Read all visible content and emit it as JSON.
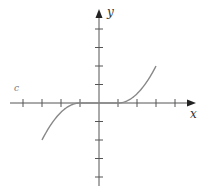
{
  "chart_data": {
    "type": "line",
    "title": "",
    "xlabel": "x",
    "ylabel": "y",
    "stray_label": "c",
    "xlim": [
      -4,
      4
    ],
    "ylim": [
      -4,
      4
    ],
    "x_ticks": [
      -4,
      -3,
      -2,
      -1,
      1,
      2,
      3,
      4
    ],
    "y_ticks": [
      -4,
      -3,
      -2,
      -1,
      1,
      2,
      3,
      4
    ],
    "tick_labels_shown": false,
    "grid": false,
    "series": [
      {
        "name": "f(x)",
        "description": "flat at 0 on [-1,1], rising as (x-1)^2/2 for x>1, falling as -(x+1)^2/2 for x<-1",
        "x": [
          -3,
          -2.5,
          -2,
          -1.5,
          -1,
          0,
          1,
          1.5,
          2,
          2.5,
          3
        ],
        "y": [
          -2,
          -1.125,
          -0.5,
          -0.125,
          0,
          0,
          0,
          0.125,
          0.5,
          1.125,
          2
        ]
      }
    ],
    "colors": {
      "axis": "#555555",
      "curve": "#888888"
    }
  }
}
